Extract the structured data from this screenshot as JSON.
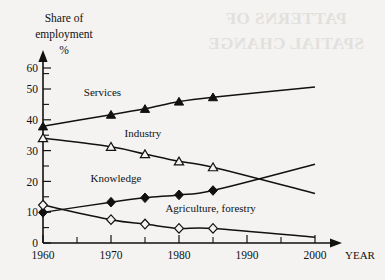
{
  "background_color": "#f4f3f1",
  "ink_color": "#111111",
  "showthrough": {
    "text": "PATTERNS OF SPATIAL CHANGE",
    "note": "faint mirrored bleed-through from reverse page",
    "color": "#e2e0dd"
  },
  "axis": {
    "y_title_line1": "Share of",
    "y_title_line2": "employment",
    "y_title_line3": "%",
    "x_title": "YEAR",
    "y_ticks": [
      "0",
      "10",
      "20",
      "30",
      "40",
      "50",
      "60"
    ],
    "x_ticks": [
      "1960",
      "1970",
      "1980",
      "1990",
      "2000"
    ]
  },
  "chart_data": {
    "type": "line",
    "title": "",
    "xlabel": "YEAR",
    "ylabel": "Share of employment %",
    "xlim": [
      1960,
      2000
    ],
    "ylim": [
      0,
      60
    ],
    "y_tick_values": [
      0,
      10,
      20,
      30,
      40,
      50,
      60
    ],
    "y_minor_tick_values": [
      5,
      15,
      25,
      35,
      45,
      55
    ],
    "x_tick_values": [
      1960,
      1970,
      1980,
      1990,
      2000
    ],
    "x_minor_tick_values": [
      1965,
      1975,
      1985,
      1995
    ],
    "grid": false,
    "legend": "inline-labels",
    "series": [
      {
        "name": "Services",
        "marker": "filled-triangle",
        "label": "Services",
        "label_x": 1966,
        "label_y": 50.5,
        "x": [
          1960,
          1970,
          1975,
          1980,
          1985,
          2000
        ],
        "y": [
          40,
          44,
          46,
          48.5,
          50,
          53.5
        ],
        "marker_x": [
          1960,
          1970,
          1975,
          1980,
          1985
        ],
        "marker_y": [
          40,
          44,
          46,
          48.5,
          50
        ]
      },
      {
        "name": "Industry",
        "marker": "open-triangle",
        "label": "Industry",
        "label_x": 1972,
        "label_y": 36.5,
        "x": [
          1960,
          1970,
          1975,
          1980,
          1985,
          2000
        ],
        "y": [
          36,
          33,
          30.5,
          28,
          26,
          17
        ],
        "marker_x": [
          1960,
          1970,
          1975,
          1980,
          1985
        ],
        "marker_y": [
          36,
          33,
          30.5,
          28,
          26
        ]
      },
      {
        "name": "Knowledge",
        "marker": "filled-diamond",
        "label": "Knowledge",
        "label_x": 1967,
        "label_y": 21,
        "x": [
          1960,
          1970,
          1975,
          1980,
          1985,
          2000
        ],
        "y": [
          10.5,
          14,
          15.5,
          16.5,
          18,
          27
        ],
        "marker_x": [
          1960,
          1970,
          1975,
          1980,
          1985
        ],
        "marker_y": [
          10.5,
          14,
          15.5,
          16.5,
          18
        ]
      },
      {
        "name": "Agriculture, forestry",
        "marker": "open-diamond",
        "label": "Agriculture, forestry",
        "label_x": 1978,
        "label_y": 10.5,
        "x": [
          1960,
          1970,
          1975,
          1980,
          1985,
          2000
        ],
        "y": [
          13,
          8,
          6.5,
          5,
          5,
          2
        ],
        "marker_x": [
          1960,
          1970,
          1975,
          1980,
          1985
        ],
        "marker_y": [
          13,
          8,
          6.5,
          5,
          5
        ]
      }
    ]
  }
}
